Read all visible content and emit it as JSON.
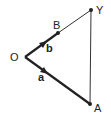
{
  "diagram": {
    "points": {
      "O": {
        "label": "O",
        "x": 25,
        "y": 57
      },
      "B": {
        "label": "B",
        "x": 58,
        "y": 33
      },
      "Y": {
        "label": "Y",
        "x": 91,
        "y": 10
      },
      "A": {
        "label": "A",
        "x": 90,
        "y": 104
      }
    },
    "vectors": {
      "a": {
        "label": "a",
        "from": "O",
        "to": "A"
      },
      "b": {
        "label": "b",
        "from": "O",
        "to": "B"
      }
    },
    "colors": {
      "line": "#222222",
      "background": "#ffffff"
    }
  }
}
